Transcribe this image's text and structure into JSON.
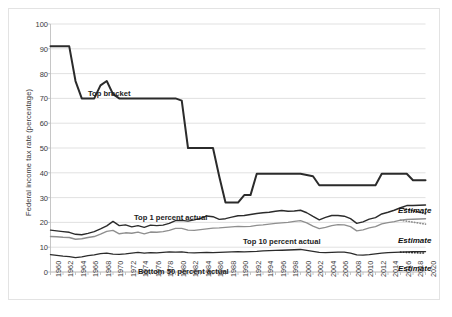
{
  "chart_data": {
    "type": "line",
    "title": "",
    "xlabel": "",
    "ylabel": "Federal income tax rate (percentage)",
    "ylim": [
      0,
      100
    ],
    "ytick_values": [
      0,
      10,
      20,
      30,
      40,
      50,
      60,
      70,
      80,
      90,
      100
    ],
    "ytick_labels": [
      "0",
      "10",
      "20",
      "30",
      "40",
      "50",
      "60",
      "70",
      "80",
      "90",
      "100"
    ],
    "xlim": [
      1960,
      2020
    ],
    "xtick_labels": [
      "1960",
      "1962",
      "1964",
      "1966",
      "1968",
      "1970",
      "1972",
      "1974",
      "1976",
      "1978",
      "1980",
      "1982",
      "1984",
      "1986",
      "1988",
      "1990",
      "1992",
      "1994",
      "1996",
      "1998",
      "2000",
      "2002",
      "2004",
      "2006",
      "2008",
      "2010",
      "2012",
      "2014",
      "2016",
      "2018",
      "2020"
    ],
    "grid": "horizontal",
    "legend_position": "inline-annotations",
    "x": [
      1960,
      1961,
      1962,
      1963,
      1964,
      1965,
      1966,
      1967,
      1968,
      1969,
      1970,
      1971,
      1972,
      1973,
      1974,
      1975,
      1976,
      1977,
      1978,
      1979,
      1980,
      1981,
      1982,
      1983,
      1984,
      1985,
      1986,
      1987,
      1988,
      1989,
      1990,
      1991,
      1992,
      1993,
      1994,
      1995,
      1996,
      1997,
      1998,
      1999,
      2000,
      2001,
      2002,
      2003,
      2004,
      2005,
      2006,
      2007,
      2008,
      2009,
      2010,
      2011,
      2012,
      2013,
      2014,
      2015,
      2016,
      2017,
      2018,
      2019,
      2020
    ],
    "series": [
      {
        "name": "Top bracket",
        "label": "Top bracket",
        "color": "#2b2b2b",
        "style": "solid",
        "width": 2.0,
        "values": [
          91,
          91,
          91,
          91,
          77,
          70,
          70,
          70,
          75.25,
          77,
          71.75,
          70,
          70,
          70,
          70,
          70,
          70,
          70,
          70,
          70,
          70,
          69.125,
          50,
          50,
          50,
          50,
          50,
          38.5,
          28,
          28,
          28,
          31,
          31,
          39.6,
          39.6,
          39.6,
          39.6,
          39.6,
          39.6,
          39.6,
          39.6,
          39.1,
          38.6,
          35,
          35,
          35,
          35,
          35,
          35,
          35,
          35,
          35,
          35,
          39.6,
          39.6,
          39.6,
          39.6,
          39.6,
          37,
          37,
          37
        ]
      },
      {
        "name": "Top 1 percent actual",
        "label": "Top 1 percent actual",
        "color": "#2b2b2b",
        "style": "solid",
        "width": 1.4,
        "values": [
          16.9,
          16.6,
          16.3,
          16.0,
          15.2,
          15.0,
          15.6,
          16.3,
          17.4,
          18.6,
          20.4,
          18.7,
          19.0,
          18.2,
          18.7,
          18.0,
          18.9,
          18.7,
          18.9,
          19.6,
          20.7,
          20.8,
          20.5,
          21.0,
          21.6,
          22.6,
          22.3,
          21.2,
          21.5,
          22.1,
          22.7,
          22.8,
          23.2,
          23.6,
          23.9,
          24.1,
          24.5,
          24.8,
          24.5,
          24.6,
          24.9,
          23.9,
          22.4,
          21.0,
          22.0,
          22.8,
          22.8,
          22.5,
          21.5,
          19.6,
          20.2,
          21.3,
          21.9,
          23.4,
          24.1,
          24.9,
          25.9,
          26.8,
          26.8,
          26.9,
          27.0
        ]
      },
      {
        "name": "Top 10 percent actual",
        "label": "Top 10 percent actual",
        "color": "#8f8f8f",
        "style": "solid",
        "width": 1.4,
        "values": [
          14.3,
          14.2,
          14.0,
          13.9,
          13.2,
          13.4,
          13.9,
          14.3,
          15.3,
          16.4,
          16.8,
          15.4,
          15.8,
          15.6,
          16.1,
          15.4,
          16.1,
          16.0,
          16.3,
          16.8,
          17.6,
          17.6,
          16.9,
          16.8,
          17.1,
          17.4,
          17.7,
          17.8,
          18.0,
          18.2,
          18.4,
          18.3,
          18.4,
          18.8,
          19.0,
          19.3,
          19.6,
          19.8,
          20.0,
          20.4,
          20.7,
          19.8,
          18.5,
          17.5,
          18.0,
          18.7,
          19.1,
          19.0,
          18.3,
          16.6,
          17.0,
          17.8,
          18.3,
          19.4,
          19.9,
          20.3,
          20.9,
          21.2,
          21.3,
          21.4,
          21.5
        ]
      },
      {
        "name": "Bottom 50 percent actual",
        "label": "Bottom 50 percent actual",
        "color": "#2b2b2b",
        "style": "solid",
        "width": 1.4,
        "values": [
          7.0,
          6.7,
          6.4,
          6.2,
          5.8,
          6.1,
          6.6,
          6.9,
          7.4,
          7.6,
          7.2,
          7.1,
          7.3,
          7.6,
          7.9,
          7.6,
          7.8,
          7.7,
          7.9,
          8.1,
          8.0,
          8.1,
          7.8,
          7.7,
          7.8,
          7.9,
          7.8,
          7.9,
          8.0,
          8.1,
          8.2,
          8.1,
          8.2,
          8.3,
          8.5,
          8.6,
          8.7,
          8.8,
          8.9,
          9.0,
          9.1,
          8.7,
          8.3,
          7.9,
          7.8,
          7.9,
          8.0,
          8.0,
          7.6,
          6.9,
          6.8,
          7.0,
          7.3,
          7.6,
          7.8,
          7.9,
          8.0,
          8.1,
          8.2,
          8.2,
          8.2
        ]
      }
    ],
    "estimate_segments": [
      {
        "series": "Top 1 percent actual",
        "label": "Estimate",
        "style": "dotted",
        "x_start": 2016,
        "x_end": 2020,
        "y_start": 25.9,
        "y_end": 23.5,
        "color": "#2b2b2b"
      },
      {
        "series": "Top 10 percent actual",
        "label": "Estimate",
        "style": "dotted",
        "x_start": 2016,
        "x_end": 2020,
        "y_start": 20.9,
        "y_end": 19.3,
        "color": "#8f8f8f"
      },
      {
        "series": "Bottom 50 percent actual",
        "label": "Estimate",
        "style": "dotted",
        "x_start": 2016,
        "x_end": 2020,
        "y_start": 8.0,
        "y_end": 7.6,
        "color": "#2b2b2b"
      }
    ],
    "annotations": [
      {
        "name": "top-bracket-label",
        "text": "Top bracket",
        "x_px": 88,
        "y_px": 89
      },
      {
        "name": "top-1-percent-label",
        "text": "Top 1 percent actual",
        "x_px": 134,
        "y_px": 213
      },
      {
        "name": "top-10-percent-label",
        "text": "Top 10 percent actual",
        "x_px": 243,
        "y_px": 237
      },
      {
        "name": "bottom-50-percent-label",
        "text": "Bottom 50 percent actual",
        "x_px": 138,
        "y_px": 267
      },
      {
        "name": "estimate-label-top1",
        "text": "Estimate",
        "x_px": 398,
        "y_px": 206
      },
      {
        "name": "estimate-label-top10",
        "text": "Estimate",
        "x_px": 398,
        "y_px": 236
      },
      {
        "name": "estimate-label-bottom50",
        "text": "Estimate",
        "x_px": 398,
        "y_px": 264
      }
    ],
    "colors": {
      "dark_line": "#2b2b2b",
      "gray_line": "#8f8f8f",
      "gridline": "#d9d9d9",
      "axis": "#bfbfbf",
      "text": "#3a3a3a",
      "background": "#ffffff",
      "frame": "#e3e3e3"
    }
  }
}
